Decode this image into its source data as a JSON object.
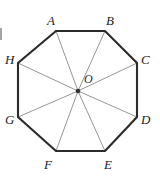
{
  "figure": {
    "kind": "regular-octagon-with-center-radii",
    "shape_name": "octagon",
    "center_label": "O",
    "stroke_outline_color": "#2b2b2b",
    "stroke_radii_color": "#8a8a8a",
    "background_color": "#ffffff",
    "center_dot_color": "#333333",
    "vertices": [
      {
        "label": "A",
        "x": 56,
        "y": 31,
        "label_x": 47,
        "label_y": 14
      },
      {
        "label": "B",
        "x": 105,
        "y": 31,
        "label_x": 106,
        "label_y": 14
      },
      {
        "label": "C",
        "x": 137,
        "y": 63,
        "label_x": 141,
        "label_y": 53
      },
      {
        "label": "D",
        "x": 137,
        "y": 117,
        "label_x": 141,
        "label_y": 113
      },
      {
        "label": "E",
        "x": 105,
        "y": 151,
        "label_x": 104,
        "label_y": 158
      },
      {
        "label": "F",
        "x": 56,
        "y": 151,
        "label_x": 44,
        "label_y": 158
      },
      {
        "label": "G",
        "x": 18,
        "y": 117,
        "label_x": 5,
        "label_y": 113
      },
      {
        "label": "H",
        "x": 18,
        "y": 63,
        "label_x": 5,
        "label_y": 53
      }
    ],
    "center": {
      "x": 78,
      "y": 91,
      "label_x": 84,
      "label_y": 73
    }
  }
}
